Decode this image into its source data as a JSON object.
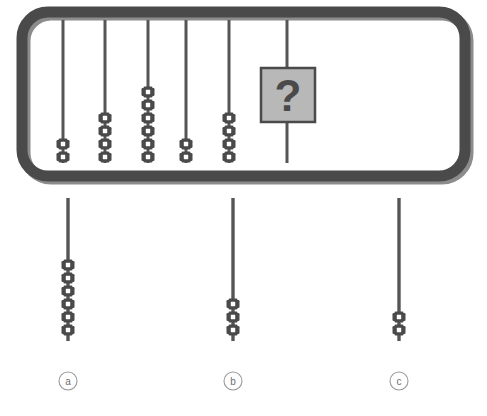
{
  "puzzle": {
    "type": "abacus-sequence-visual-reasoning",
    "title": "",
    "canvas": {
      "width": 487,
      "height": 416,
      "background": "#ffffff"
    },
    "colors": {
      "frame": "#4a4a4a",
      "frame_shadow": "#6e6e6e",
      "rod": "#555555",
      "bead": "#4a4a4a",
      "bead_hole": "#ffffff",
      "box_fill": "#b8b8b8",
      "box_border": "#4a4a4a",
      "question_mark": "#4a4a4a",
      "label_circle": "#9a9a9a",
      "label_text": "#6e6e6e"
    },
    "frame": {
      "name": "abacus-frame",
      "x": 22,
      "y": 12,
      "width": 443,
      "height": 164,
      "corner_radius": 26,
      "stroke_width": 11
    },
    "rods": [
      {
        "id": "rod-1",
        "x": 63,
        "bead_count": 2,
        "has_question_box": false
      },
      {
        "id": "rod-2",
        "x": 105,
        "bead_count": 4,
        "has_question_box": false
      },
      {
        "id": "rod-3",
        "x": 148,
        "bead_count": 6,
        "has_question_box": false
      },
      {
        "id": "rod-4",
        "x": 186,
        "bead_count": 2,
        "has_question_box": false
      },
      {
        "id": "rod-5",
        "x": 229,
        "bead_count": 4,
        "has_question_box": false
      },
      {
        "id": "rod-6",
        "x": 287,
        "bead_count": 0,
        "has_question_box": true
      }
    ],
    "rod_geometry": {
      "top_y": 20,
      "bottom_y": 163,
      "stroke_width": 3,
      "bead_pitch": 13,
      "bead_width": 13,
      "bead_height": 11
    },
    "question_box": {
      "name": "question-box",
      "x": 261,
      "y": 68,
      "width": 54,
      "height": 54,
      "symbol": "?"
    },
    "options": [
      {
        "id": "option-a",
        "label": "a",
        "x": 68,
        "rod_top_y": 198,
        "rod_bottom_y": 341,
        "bead_count": 6,
        "label_circle_y": 381
      },
      {
        "id": "option-b",
        "label": "b",
        "x": 233,
        "rod_top_y": 198,
        "rod_bottom_y": 341,
        "bead_count": 3,
        "label_circle_y": 381
      },
      {
        "id": "option-c",
        "label": "c",
        "x": 399,
        "rod_top_y": 198,
        "rod_bottom_y": 341,
        "bead_count": 2,
        "label_circle_y": 381
      }
    ],
    "label_circle_radius": 9
  }
}
